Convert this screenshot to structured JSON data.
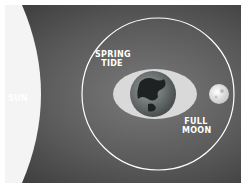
{
  "diagram": {
    "labels": {
      "sun": "SUN",
      "tide_line1": "SPRING",
      "tide_line2": "TIDE",
      "moon_line1": "FULL",
      "moon_line2": "MOON"
    },
    "colors": {
      "background": "#555555",
      "sun": "#f4f4f4",
      "tidal_bulge": "#d9d9d9",
      "orbit": "#ffffff",
      "label": "#ffffff"
    }
  }
}
